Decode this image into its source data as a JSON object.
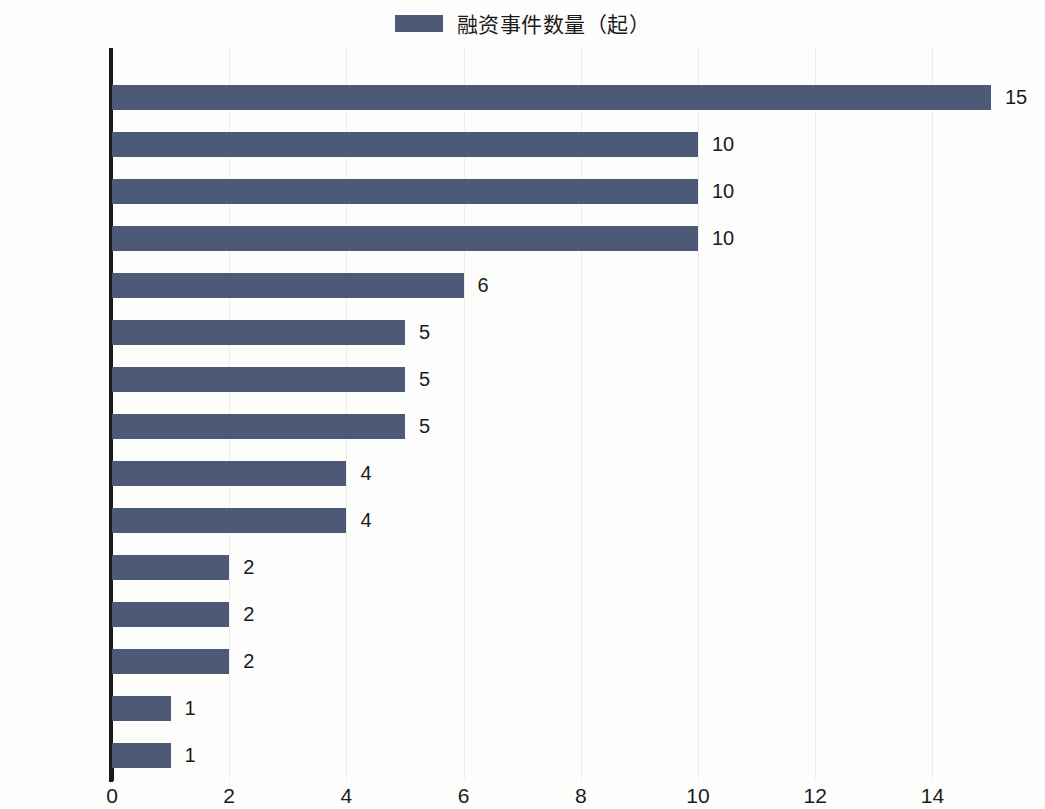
{
  "legend": {
    "label": "融资事件数量（起）",
    "color": "#4c5a78"
  },
  "chart_data": {
    "type": "bar",
    "orientation": "horizontal",
    "title": "",
    "subtitle": "",
    "xlabel": "",
    "ylabel": "",
    "xlim": [
      0,
      15.5
    ],
    "xticks": [
      0,
      2,
      4,
      6,
      8,
      10,
      12,
      14
    ],
    "xtick_labels": [
      "0",
      "2",
      "4",
      "6",
      "8",
      "10",
      "12",
      "14"
    ],
    "grid": "vertical",
    "legend_position": "top-center",
    "series": [
      {
        "name": "融资事件数量（起）",
        "color": "#4c5a78",
        "values": [
          15,
          10,
          10,
          10,
          6,
          5,
          5,
          5,
          4,
          4,
          2,
          2,
          2,
          1,
          1
        ]
      }
    ],
    "categories": [
      "奉贤区",
      "闵行区",
      "浦东新区",
      "嘉定区",
      "普陀区",
      "长宁区",
      "金山区",
      "徐汇区",
      "松江区",
      "宝山区",
      "黄浦区",
      "青浦区",
      "杨浦区",
      "虹口区",
      "崇明区"
    ],
    "data_labels": [
      "15",
      "10",
      "10",
      "10",
      "6",
      "5",
      "5",
      "5",
      "4",
      "4",
      "2",
      "2",
      "2",
      "1",
      "1"
    ]
  }
}
